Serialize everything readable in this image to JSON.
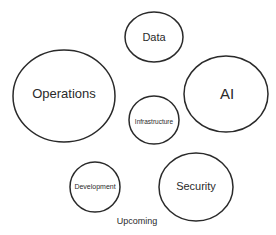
{
  "diagram": {
    "nodes": [
      {
        "id": "data",
        "label": "Data",
        "cx": 154,
        "cy": 37,
        "rx": 29,
        "ry": 25,
        "font_size": 11
      },
      {
        "id": "operations",
        "label": "Operations",
        "cx": 64,
        "cy": 96,
        "rx": 51,
        "ry": 46,
        "font_size": 13
      },
      {
        "id": "ai",
        "label": "AI",
        "cx": 226,
        "cy": 94,
        "rx": 42,
        "ry": 38,
        "font_size": 15
      },
      {
        "id": "infrastructure",
        "label": "Infrastructure",
        "cx": 154,
        "cy": 120,
        "rx": 25,
        "ry": 24,
        "font_size": 6.5
      },
      {
        "id": "development",
        "label": "Development",
        "cx": 95,
        "cy": 187,
        "rx": 25,
        "ry": 25,
        "font_size": 7
      },
      {
        "id": "security",
        "label": "Security",
        "cx": 196,
        "cy": 187,
        "rx": 37,
        "ry": 34,
        "font_size": 11
      }
    ],
    "caption": {
      "label": "Upcoming",
      "x": 137,
      "y": 221,
      "font_size": 9
    },
    "stroke_color": "#2a2a2a"
  }
}
